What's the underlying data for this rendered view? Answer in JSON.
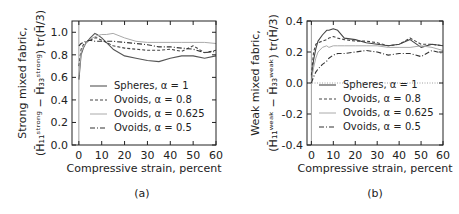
{
  "chart_data": [
    {
      "type": "line",
      "panel_label": "(a)",
      "title": "",
      "xlabel": "Compressive strain, percent",
      "ylabel_line1": "Strong mixed fabric,",
      "ylabel_line2": "(H̄₁₁ˢᵗʳᵒⁿᵍ − H̄₃₃ˢᵗʳᵒⁿᵍ) tr(H̄/3)",
      "xlim": [
        -3,
        60
      ],
      "ylim": [
        0.0,
        1.1
      ],
      "xticks": [
        0,
        10,
        20,
        30,
        40,
        50,
        60
      ],
      "yticks": [
        0.0,
        0.2,
        0.4,
        0.6,
        0.8,
        1.0
      ],
      "ytick_labels": [
        "0.0",
        "0.2",
        "0.4",
        "0.6",
        "0.8",
        "1.0"
      ],
      "grid": false,
      "legend_position": "lower right",
      "x": [
        0,
        1,
        2,
        3,
        5,
        7,
        8,
        10,
        12,
        15,
        20,
        25,
        30,
        35,
        40,
        45,
        50,
        55,
        60
      ],
      "series": [
        {
          "name": "Spheres, α = 1",
          "style": "solid",
          "color": "#555555",
          "values": [
            0.58,
            0.8,
            0.86,
            0.9,
            0.95,
            0.99,
            0.98,
            0.95,
            0.91,
            0.85,
            0.79,
            0.77,
            0.75,
            0.74,
            0.77,
            0.79,
            0.79,
            0.77,
            0.79
          ]
        },
        {
          "name": "Ovoids, α = 0.8",
          "style": "dashed",
          "color": "#444444",
          "values": [
            0.7,
            0.85,
            0.89,
            0.91,
            0.93,
            0.95,
            0.95,
            0.93,
            0.91,
            0.88,
            0.86,
            0.85,
            0.84,
            0.84,
            0.85,
            0.83,
            0.88,
            0.82,
            0.84
          ]
        },
        {
          "name": "Ovoids, α = 0.625",
          "style": "solid-light",
          "color": "#aaaaaa",
          "values": [
            0.62,
            0.82,
            0.87,
            0.9,
            0.94,
            0.96,
            0.97,
            0.98,
            0.98,
            0.99,
            0.95,
            0.92,
            0.91,
            0.91,
            0.91,
            0.91,
            0.91,
            0.91,
            0.9
          ]
        },
        {
          "name": "Ovoids, α = 0.5",
          "style": "dashdot",
          "color": "#333333",
          "values": [
            0.88,
            0.9,
            0.91,
            0.92,
            0.93,
            0.92,
            0.92,
            0.92,
            0.92,
            0.92,
            0.91,
            0.9,
            0.89,
            0.87,
            0.87,
            0.86,
            0.85,
            0.82,
            0.83
          ]
        }
      ]
    },
    {
      "type": "line",
      "panel_label": "(b)",
      "title": "",
      "xlabel": "Compressive strain, percent",
      "ylabel_line1": "Weak mixed fabric,",
      "ylabel_line2": "(H̄₁₁ʷᵉᵃᵏ − H̄₃₃ʷᵉᵃᵏ) tr(H̄/3)",
      "xlim": [
        -2,
        60
      ],
      "ylim": [
        -0.4,
        0.4
      ],
      "xticks": [
        0,
        10,
        20,
        30,
        40,
        50,
        60
      ],
      "yticks": [
        -0.4,
        -0.2,
        0.0,
        0.2,
        0.4
      ],
      "ytick_labels": [
        "-0.4",
        "-0.2",
        "0.0",
        "0.2",
        "0.4"
      ],
      "grid": false,
      "reference_line_y": 0.0,
      "legend_position": "lower right",
      "x": [
        0,
        1,
        2,
        3,
        5,
        7,
        8,
        10,
        12,
        15,
        20,
        25,
        30,
        35,
        40,
        45,
        50,
        55,
        60
      ],
      "series": [
        {
          "name": "Spheres, α = 1",
          "style": "solid",
          "color": "#444444",
          "values": [
            0.02,
            0.15,
            0.22,
            0.27,
            0.31,
            0.34,
            0.34,
            0.35,
            0.34,
            0.29,
            0.28,
            0.26,
            0.25,
            0.24,
            0.25,
            0.28,
            0.23,
            0.25,
            0.24
          ]
        },
        {
          "name": "Ovoids, α = 0.8",
          "style": "dashed",
          "color": "#444444",
          "values": [
            0.05,
            0.2,
            0.25,
            0.26,
            0.27,
            0.28,
            0.29,
            0.3,
            0.29,
            0.28,
            0.27,
            0.27,
            0.26,
            0.24,
            0.25,
            0.29,
            0.25,
            0.25,
            0.24
          ]
        },
        {
          "name": "Ovoids, α = 0.625",
          "style": "solid-light",
          "color": "#aaaaaa",
          "values": [
            0.01,
            0.1,
            0.16,
            0.2,
            0.23,
            0.24,
            0.23,
            0.24,
            0.24,
            0.24,
            0.24,
            0.24,
            0.24,
            0.23,
            0.23,
            0.23,
            0.24,
            0.23,
            0.21
          ]
        },
        {
          "name": "Ovoids, α = 0.5",
          "style": "dashdot",
          "color": "#333333",
          "values": [
            0.0,
            0.04,
            0.07,
            0.09,
            0.12,
            0.14,
            0.16,
            0.18,
            0.19,
            0.19,
            0.2,
            0.21,
            0.2,
            0.18,
            0.19,
            0.19,
            0.17,
            0.21,
            0.19
          ]
        }
      ]
    }
  ]
}
